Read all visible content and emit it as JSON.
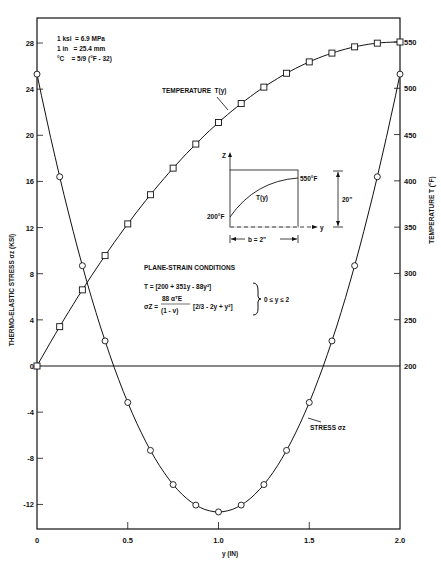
{
  "chart_data": {
    "type": "line",
    "title": "",
    "xlabel": "y (IN)",
    "ylabel": "THERMO-ELASTIC STRESS σz (KSI)",
    "ylabel_right": "TEMPERATURE T (°F)",
    "xlim": [
      0,
      2.0
    ],
    "ylim": [
      -14,
      30
    ],
    "ylim_right": [
      200,
      550
    ],
    "x_ticks": [
      "0",
      "0.5",
      "1.0",
      "1.5",
      "2.0"
    ],
    "y_ticks": [
      "28",
      "24",
      "20",
      "16",
      "12",
      "8",
      "4",
      "0",
      "-4",
      "-8",
      "-12"
    ],
    "y_ticks_right": [
      "550",
      "500",
      "450",
      "400",
      "350",
      "300",
      "250",
      "200"
    ],
    "grid": false,
    "x": [
      0,
      0.125,
      0.25,
      0.375,
      0.5,
      0.625,
      0.75,
      0.875,
      1.0,
      1.125,
      1.25,
      1.375,
      1.5,
      1.625,
      1.75,
      1.875,
      2.0
    ],
    "series": [
      {
        "name": "TEMPERATURE T(y)",
        "axis": "right",
        "marker": "square",
        "values": [
          200,
          242.5,
          282.3,
          319.2,
          353.5,
          385.0,
          463.8,
          440.2,
          463.0,
          483.5,
          501.3,
          516.3,
          528.5,
          538.9,
          545.5,
          549.2,
          550
        ]
      },
      {
        "name": "STRESS σz",
        "axis": "left",
        "marker": "circle",
        "values": [
          25.3,
          16.4,
          8.7,
          2.4,
          -3.2,
          -7.7,
          -10.7,
          -12.1,
          -12.65,
          -12.1,
          -10.7,
          -7.7,
          -3.2,
          2.4,
          8.7,
          16.4,
          25.3
        ]
      }
    ],
    "annotations": {
      "conversions": [
        "1 ksi  = 6.9 MPa",
        "1 in   = 25.4 mm",
        "°C    = 5/9 (°F - 32)"
      ],
      "temperature_label": "TEMPERATURE  T(y)",
      "stress_label": "STRESS σz",
      "conditions_title": "PLANE-STRAIN CONDITIONS",
      "eq_T": "T = [200 + 351y - 88y²]",
      "eq_sigma_lhs": "σZ =",
      "eq_sigma_num": "88 αᵀE",
      "eq_sigma_den": "(1 - ν)",
      "eq_sigma_rhs": "[2/3 - 2y + y²]",
      "range": "0 ≤ y ≤ 2",
      "inset": {
        "z_label": "Z",
        "y_label": "y",
        "t_curve_label": "T(y)",
        "t_low": "200°F",
        "t_high": "550°F",
        "height": "20\"",
        "width": "b = 2\""
      }
    }
  }
}
